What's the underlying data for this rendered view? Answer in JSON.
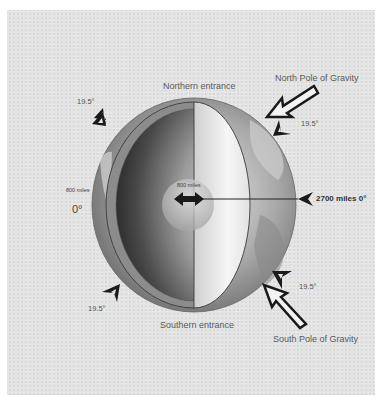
{
  "diagram": {
    "type": "hollow-earth cutaway",
    "colors": {
      "background_outer": "#ffffff",
      "panel": "#e4e4e4",
      "arrow": "#1a1a1a",
      "text": "#555555"
    },
    "labels": {
      "northern_entrance": "Northern entrance",
      "southern_entrance": "Southern entrance",
      "north_pole_gravity": "North Pole of Gravity",
      "south_pole_gravity": "South Pole of Gravity",
      "core_diameter": "800 miles",
      "shell_thickness": "800 miles",
      "radius": "2700 miles 0°",
      "equator_degree": "0°",
      "angle_top_left": "19.5°",
      "angle_top_right": "19.5°",
      "angle_bottom_left": "19.5°",
      "angle_bottom_right": "19.5°"
    },
    "icons": [
      "triangle-marker-icon-top-left",
      "triangle-marker-icon-top-right",
      "triangle-marker-icon-bottom-left",
      "triangle-marker-icon-bottom-right",
      "north-gravity-arrow-icon",
      "south-gravity-arrow-icon",
      "radius-pointer-icon",
      "double-arrow-icon"
    ]
  }
}
